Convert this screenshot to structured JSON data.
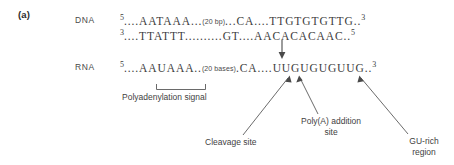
{
  "figure": {
    "panel_letter": "(a)",
    "background_color": "#ffffff",
    "text_color": "#3a3a3a"
  },
  "rows": {
    "dna": {
      "label": "DNA",
      "top_strand": {
        "five_prime": "5",
        "left_dots": "....",
        "signal": "AATAAA",
        "mid_dots": "...",
        "gap": "(20 bp)",
        "post_gap_dots": "...",
        "cleavage_dinucleotide": "CA",
        "right_dots": "....",
        "gu_rich": "TTGTGTGTTG",
        "end_dots": "..",
        "three_prime": "3"
      },
      "bottom_strand": {
        "three_prime": "3",
        "left_dots": "....",
        "signal": "TTATTT",
        "mid_dots": "..........",
        "cleavage_dinucleotide": "GT",
        "right_dots": "....",
        "gu_rich": "AACACACAAC",
        "end_dots": "..",
        "five_prime": "5"
      }
    },
    "rna": {
      "label": "RNA",
      "strand": {
        "five_prime": "5",
        "left_dots": "....",
        "signal": "AAUAAA",
        "mid_dots": "..",
        "gap": "(20 bases)",
        "post_gap_dots": ".",
        "cleavage_dinucleotide": "CA",
        "right_dots": "....",
        "gu_rich": "UUGUGUGUUG",
        "end_dots": "..",
        "three_prime": "3"
      }
    }
  },
  "annotations": {
    "polyadenylation_signal": "Polyadenylation signal",
    "cleavage_site": "Cleavage site",
    "polya_addition_site_line1": "Poly(A) addition",
    "polya_addition_site_line2": "site",
    "gu_rich_region_line1": "GU-rich",
    "gu_rich_region_line2": "region"
  },
  "icons": {
    "cleavage_down_arrow": "down-arrow-icon",
    "signal_bracket": "bracket-icon",
    "leader_lines": "leader-line-icon"
  }
}
